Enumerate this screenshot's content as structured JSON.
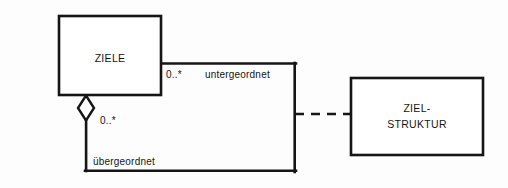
{
  "diagram": {
    "type": "uml-class-diagram",
    "notation": "UML",
    "language": "de",
    "background_color": "#fdfdfd",
    "stroke_color": "#151515",
    "fill_color": "#ffffff",
    "classes": [
      {
        "id": "ziele",
        "name": "ZIELE",
        "name_lines": [
          "ZIELE"
        ],
        "x": 59,
        "y": 16,
        "width": 102,
        "height": 79
      },
      {
        "id": "zielstruktur",
        "name": "ZIEL-STRUKTUR",
        "name_lines": [
          "ZIEL-",
          "STRUKTUR"
        ],
        "line1": "ZIEL-",
        "line2": "STRUKTUR",
        "x": 351,
        "y": 78,
        "width": 132,
        "height": 77
      }
    ],
    "relationships": [
      {
        "id": "ziele-self-aggregation",
        "kind": "aggregation",
        "style": "solid",
        "source": "ziele",
        "target": "ziele",
        "diamond": "hollow",
        "role_child": "untergeordnet",
        "role_parent": "übergeordnet",
        "multiplicity_child": "0..*",
        "multiplicity_parent": "0..*"
      },
      {
        "id": "link-to-zielstruktur",
        "kind": "dependency",
        "style": "dashed",
        "source": "ziele-self-aggregation",
        "target": "zielstruktur",
        "label": ""
      }
    ],
    "labels": {
      "untergeordnet": "untergeordnet",
      "uebergeordnet": "übergeordnet",
      "multiplicity_top": "0..*",
      "multiplicity_bottom": "0..*"
    }
  }
}
